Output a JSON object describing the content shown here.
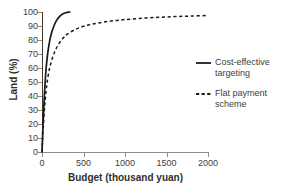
{
  "chart_data": {
    "type": "line",
    "title": "",
    "xlabel": "Budget (thousand yuan)",
    "ylabel": "Land (%)",
    "xlim": [
      0,
      2000
    ],
    "ylim": [
      0,
      100
    ],
    "xticks": [
      0,
      500,
      1000,
      1500,
      2000
    ],
    "yticks": [
      0,
      10,
      20,
      30,
      40,
      50,
      60,
      70,
      80,
      90,
      100
    ],
    "grid": false,
    "legend_position": "right",
    "series": [
      {
        "name": "Cost-effective targeting",
        "style": "solid",
        "color": "#1a1a1a",
        "x": [
          0,
          10,
          20,
          30,
          40,
          50,
          60,
          70,
          80,
          90,
          100,
          120,
          140,
          160,
          180,
          200,
          230,
          260,
          290,
          320,
          335
        ],
        "y": [
          0,
          16,
          30,
          42,
          52,
          60,
          66,
          71,
          75,
          78.5,
          81.5,
          86,
          89.5,
          92.3,
          94.4,
          96,
          97.8,
          98.9,
          99.5,
          99.9,
          100
        ]
      },
      {
        "name": "Flat payment scheme",
        "style": "dashed",
        "color": "#1a1a1a",
        "x": [
          0,
          10,
          20,
          30,
          40,
          50,
          60,
          80,
          100,
          130,
          160,
          200,
          250,
          300,
          400,
          500,
          600,
          700,
          800,
          900,
          1000,
          1200,
          1400,
          1600,
          1800,
          2000
        ],
        "y": [
          0,
          12,
          22,
          31,
          38,
          44,
          49,
          56.5,
          62,
          68,
          72.5,
          77,
          81,
          84,
          87.5,
          89.8,
          91.3,
          92.4,
          93.3,
          94,
          94.6,
          95.5,
          96.2,
          96.7,
          97.1,
          97.5
        ]
      }
    ]
  },
  "legend": {
    "items": [
      {
        "label": "Cost-effective targeting",
        "style": "solid"
      },
      {
        "label": "Flat payment scheme",
        "style": "dashed"
      }
    ]
  },
  "colors": {
    "axis": "#8c8c8c",
    "yaxis": "#3b3b3b",
    "text": "#3d3d3d",
    "title_text": "#2f2f2f",
    "curve": "#1a1a1a",
    "background": "#ffffff"
  }
}
